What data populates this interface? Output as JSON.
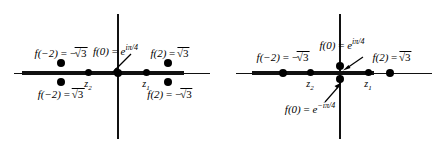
{
  "figure": {
    "type": "complex-plane-diagram",
    "panel_count": 2,
    "background_color": "#ffffff",
    "axis_color": "#111111",
    "dot_color": "#000000"
  },
  "panels": [
    {
      "id": "left",
      "name": "branch-values-split-panel",
      "origin": {
        "x": 118,
        "y": 73
      },
      "labels": {
        "left_upper": {
          "fn": "f(−2)",
          "eq": " = −",
          "radical": "√3"
        },
        "left_lower": {
          "fn": "f(−2)",
          "eq": " = ",
          "radical": "√3"
        },
        "center": {
          "fn": "f(0)",
          "eq": " = ",
          "expr": "e",
          "exponent": "iπ/4"
        },
        "right_upper": {
          "fn": "f(2)",
          "eq": " = ",
          "radical": "√3"
        },
        "right_lower": {
          "fn": "f(2)",
          "eq": " = −",
          "radical": "√3"
        }
      },
      "markers": {
        "z2": "z",
        "z2_sub": "2",
        "z1": "z",
        "z1_sub": "1"
      }
    },
    {
      "id": "right",
      "name": "branch-values-merged-panel",
      "origin": {
        "x": 118,
        "y": 73
      },
      "labels": {
        "left_upper": {
          "fn": "f(−2)",
          "eq": " = −",
          "radical": "√3"
        },
        "center_upper": {
          "fn": "f(0)",
          "eq": " = ",
          "expr": "e",
          "exponent": "iπ/4"
        },
        "center_lower": {
          "fn": "f(0)",
          "eq": " = ",
          "expr": "e",
          "exponent": "−iπ/4"
        },
        "right_upper": {
          "fn": "f(2)",
          "eq": " = ",
          "radical": "√3"
        }
      },
      "markers": {
        "z2": "z",
        "z2_sub": "2",
        "z1": "z",
        "z1_sub": "1"
      }
    }
  ]
}
